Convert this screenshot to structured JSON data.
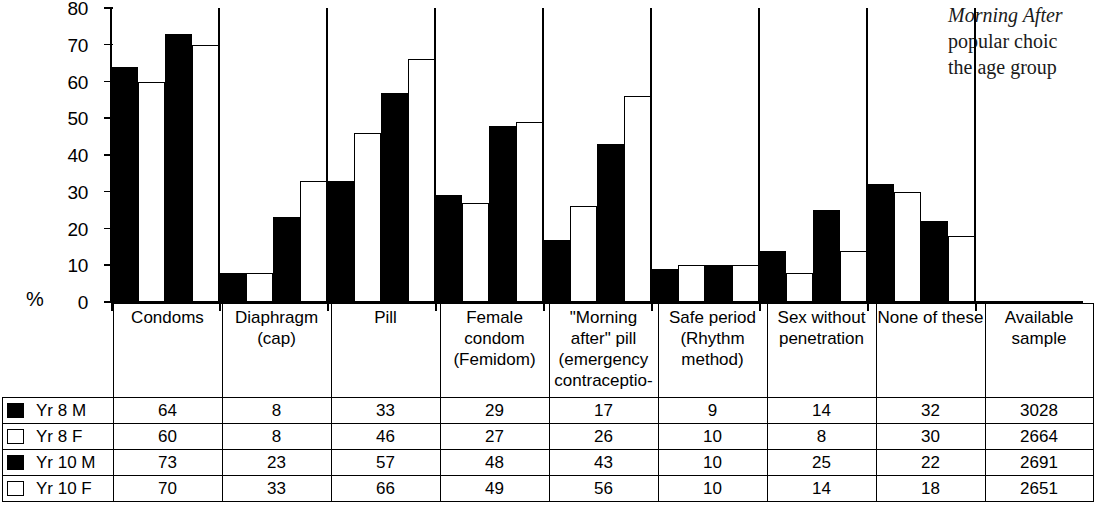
{
  "sidenote": {
    "line1": "Morning After",
    "line2": "popular choic",
    "line3": "the age group"
  },
  "axis": {
    "percent_label": "%",
    "yticks": [
      "80",
      "70",
      "60",
      "50",
      "40",
      "30",
      "20",
      "10",
      "0"
    ]
  },
  "table": {
    "sample_header": "Available\nsample",
    "series_labels": [
      "Yr 8 M",
      "Yr 8 F",
      "Yr 10 M",
      "Yr 10 F"
    ],
    "series_swatches": [
      "solid",
      "hollow",
      "solid",
      "hollow"
    ],
    "samples": [
      "3028",
      "2664",
      "2691",
      "2651"
    ]
  },
  "chart_data": {
    "type": "bar",
    "title": "",
    "xlabel": "",
    "ylabel": "%",
    "ylim": [
      0,
      80
    ],
    "ytick_step": 10,
    "grid": false,
    "legend_position": "table-left",
    "categories": [
      "Condoms",
      "Diaphragm\n(cap)",
      "Pill",
      "Female\ncondom\n(Femidom)",
      "\"Morning\nafter\" pill\n(emergency\ncontraceptio-",
      "Safe period\n(Rhythm\nmethod)",
      "Sex without\npenetration",
      "None of these"
    ],
    "series": [
      {
        "name": "Yr 8 M",
        "fill": "solid",
        "values": [
          64,
          8,
          33,
          29,
          17,
          9,
          14,
          32
        ]
      },
      {
        "name": "Yr 8 F",
        "fill": "hollow",
        "values": [
          60,
          8,
          46,
          27,
          26,
          10,
          8,
          30
        ]
      },
      {
        "name": "Yr 10 M",
        "fill": "solid",
        "values": [
          73,
          23,
          57,
          48,
          43,
          10,
          25,
          22
        ]
      },
      {
        "name": "Yr 10 F",
        "fill": "hollow",
        "values": [
          70,
          33,
          66,
          49,
          56,
          10,
          14,
          18
        ]
      }
    ],
    "available_sample": [
      3028,
      2664,
      2691,
      2651
    ]
  }
}
